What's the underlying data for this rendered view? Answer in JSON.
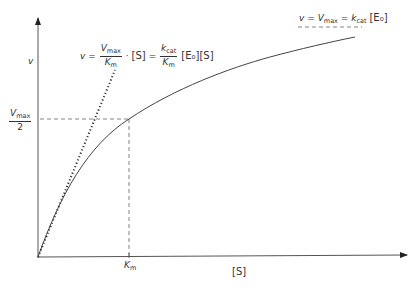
{
  "diagram": {
    "colors": {
      "line": "#555555",
      "text": "#333333",
      "background": "#ffffff"
    },
    "axes": {
      "y_label": "v",
      "x_label": "[S]",
      "x_tick": {
        "var": "K",
        "sub": "m"
      },
      "y_tick": {
        "num_var": "V",
        "num_sub": "max",
        "den": "2"
      }
    },
    "equations": {
      "saturation": {
        "lhs": "v",
        "eq1": "=",
        "vmax_var": "V",
        "vmax_sub": "max",
        "eq2": "=",
        "kcat_var": "k",
        "kcat_sub": "cat",
        "conc": "[E₀]"
      },
      "initial_slope": {
        "lhs": "v",
        "eq1": "=",
        "f1_num_var": "V",
        "f1_num_sub": "max",
        "f1_den_var": "K",
        "f1_den_sub": "m",
        "dot": "·",
        "s1": "[S]",
        "eq2": "=",
        "f2_num_var": "k",
        "f2_num_sub": "cat",
        "f2_den_var": "K",
        "f2_den_sub": "m",
        "e0": "[E₀]",
        "s2": "[S]"
      }
    },
    "curves": [
      {
        "name": "hyperbolic rate curve",
        "style": "solid"
      },
      {
        "name": "initial slope tangent",
        "style": "dotted"
      },
      {
        "name": "Vmax asymptote",
        "style": "dashed"
      },
      {
        "name": "Vmax/2 guide",
        "style": "dashed"
      },
      {
        "name": "Km guide",
        "style": "dashed"
      }
    ]
  }
}
